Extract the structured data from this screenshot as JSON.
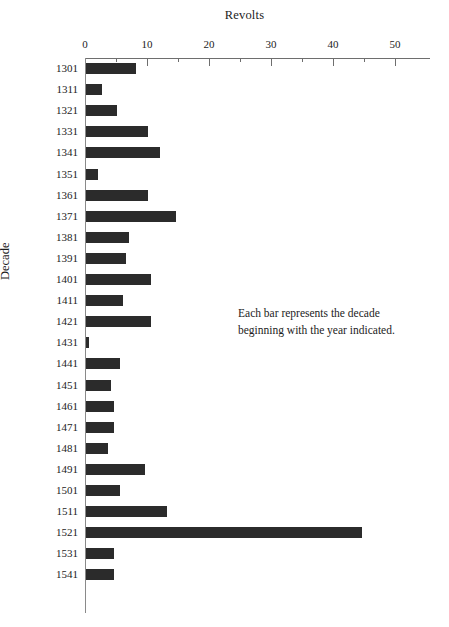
{
  "chart_data": {
    "type": "bar",
    "orientation": "horizontal",
    "title": "Revolts",
    "xlabel": "Revolts",
    "ylabel": "Decade",
    "categories": [
      "1301",
      "1311",
      "1321",
      "1331",
      "1341",
      "1351",
      "1361",
      "1371",
      "1381",
      "1391",
      "1401",
      "1411",
      "1421",
      "1431",
      "1441",
      "1451",
      "1461",
      "1471",
      "1481",
      "1491",
      "1501",
      "1511",
      "1521",
      "1531",
      "1541"
    ],
    "values": [
      8,
      2.5,
      5,
      10,
      12,
      2,
      10,
      14.5,
      7,
      6.5,
      10.5,
      6,
      10.5,
      0.5,
      5.5,
      4,
      4.5,
      4.5,
      3.5,
      9.5,
      5.5,
      13,
      44.5,
      4.5,
      4.5
    ],
    "xlim": [
      0,
      55
    ],
    "xticks": [
      0,
      10,
      20,
      30,
      40,
      50
    ],
    "xtick_labels": [
      "0",
      "10",
      "20",
      "30",
      "40",
      "50"
    ],
    "xticks_minor": [
      5,
      15,
      25,
      35,
      45
    ],
    "grid": false,
    "legend": false,
    "bar_color": "#2b2b2b",
    "axis_color": "#6e6e6e",
    "background": "#ffffff"
  },
  "annotation": {
    "line1": "Each bar represents the decade",
    "line2": "beginning with the year indicated."
  },
  "axis_titles": {
    "top": "Revolts",
    "left": "Decade"
  }
}
